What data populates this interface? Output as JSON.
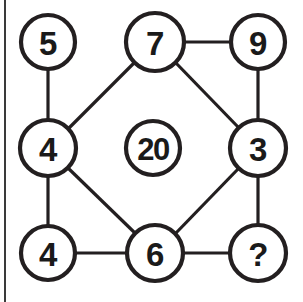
{
  "puzzle": {
    "title": "Number circle puzzle",
    "canvas": {
      "width": 303,
      "height": 302,
      "background": "#ffffff"
    },
    "style": {
      "node_stroke": "#231f20",
      "edge_stroke": "#231f20",
      "text_color": "#1a1a1a",
      "rule_color": "#3a3a3a"
    },
    "nodes": [
      {
        "id": "n-top-left",
        "label": "5",
        "cx": 48,
        "cy": 42,
        "r": 27
      },
      {
        "id": "n-top-center",
        "label": "7",
        "cx": 155,
        "cy": 42,
        "r": 29
      },
      {
        "id": "n-top-right",
        "label": "9",
        "cx": 258,
        "cy": 42,
        "r": 27
      },
      {
        "id": "n-middle-left",
        "label": "4",
        "cx": 48,
        "cy": 148,
        "r": 28
      },
      {
        "id": "n-center",
        "label": "20",
        "cx": 153,
        "cy": 148,
        "r": 27
      },
      {
        "id": "n-middle-right",
        "label": "3",
        "cx": 258,
        "cy": 148,
        "r": 28
      },
      {
        "id": "n-bottom-left",
        "label": "4",
        "cx": 48,
        "cy": 253,
        "r": 27
      },
      {
        "id": "n-bottom-center",
        "label": "6",
        "cx": 155,
        "cy": 253,
        "r": 28
      },
      {
        "id": "n-bottom-right",
        "label": "?",
        "cx": 258,
        "cy": 253,
        "r": 28
      }
    ],
    "edges": [
      {
        "id": "e-5-7",
        "from": "n-top-left",
        "to": "n-top-center",
        "x1": 75,
        "y1": 42,
        "x2": 126,
        "y2": 42
      },
      {
        "id": "e-7-9",
        "from": "n-top-center",
        "to": "n-top-right",
        "x1": 184,
        "y1": 42,
        "x2": 231,
        "y2": 42
      },
      {
        "id": "e-5-4",
        "from": "n-top-left",
        "to": "n-middle-left",
        "x1": 48,
        "y1": 69,
        "x2": 48,
        "y2": 120
      },
      {
        "id": "e-9-3",
        "from": "n-top-right",
        "to": "n-middle-right",
        "x1": 258,
        "y1": 69,
        "x2": 258,
        "y2": 120
      },
      {
        "id": "e-4-4",
        "from": "n-middle-left",
        "to": "n-bottom-left",
        "x1": 48,
        "y1": 176,
        "x2": 48,
        "y2": 226
      },
      {
        "id": "e-3-q",
        "from": "n-middle-right",
        "to": "n-bottom-right",
        "x1": 258,
        "y1": 176,
        "x2": 258,
        "y2": 225
      },
      {
        "id": "e-4-6",
        "from": "n-bottom-left",
        "to": "n-bottom-center",
        "x1": 75,
        "y1": 253,
        "x2": 127,
        "y2": 253
      },
      {
        "id": "e-6-q",
        "from": "n-bottom-center",
        "to": "n-bottom-right",
        "x1": 183,
        "y1": 253,
        "x2": 230,
        "y2": 253
      },
      {
        "id": "e-4-7",
        "from": "n-middle-left",
        "to": "n-top-center",
        "x1": 68,
        "y1": 129,
        "x2": 135,
        "y2": 62
      },
      {
        "id": "e-7-3",
        "from": "n-top-center",
        "to": "n-middle-right",
        "x1": 175,
        "y1": 62,
        "x2": 239,
        "y2": 128
      },
      {
        "id": "e-4-6d",
        "from": "n-middle-left",
        "to": "n-bottom-center",
        "x1": 68,
        "y1": 168,
        "x2": 136,
        "y2": 234
      },
      {
        "id": "e-6-3d",
        "from": "n-bottom-center",
        "to": "n-middle-right",
        "x1": 175,
        "y1": 234,
        "x2": 239,
        "y2": 168
      }
    ]
  }
}
